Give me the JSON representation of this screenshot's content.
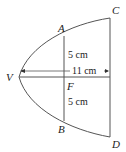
{
  "diagram": {
    "points": {
      "A": "A",
      "B": "B",
      "C": "C",
      "D": "D",
      "V": "V",
      "F": "F"
    },
    "measurements": {
      "upper_half": "5 cm",
      "lower_half": "5 cm",
      "depth": "11 cm"
    },
    "colors": {
      "stroke": "#555555",
      "text": "#222222"
    }
  }
}
